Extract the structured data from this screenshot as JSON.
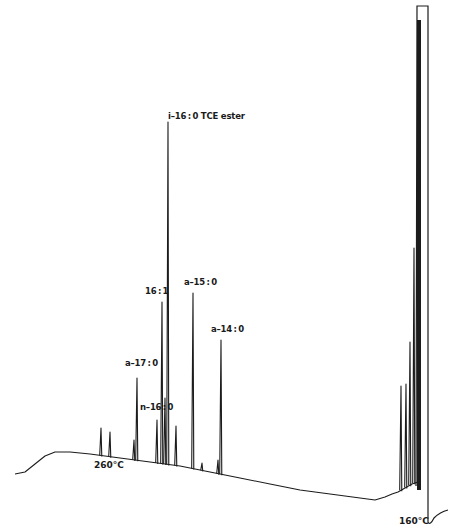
{
  "chart_data": {
    "type": "line",
    "title": "",
    "subtitle": "Gas chromatogram of fatty acid methyl/TCE esters (temperature-programmed)",
    "xlabel": "",
    "ylabel": "",
    "x_direction": "reversed (retention time increases right to left)",
    "grid": false,
    "legend": null,
    "temperature_markers": [
      {
        "label": "260°C",
        "x": 110,
        "y": 465
      },
      {
        "label": "160°C",
        "x": 418,
        "y": 520
      }
    ],
    "peaks": [
      {
        "name": "i-16:0 TCE ester",
        "label_x": 168,
        "label_y": 117,
        "peak_x": 168,
        "top_y": 122,
        "base_y": 466
      },
      {
        "name": "16:1",
        "label_x": 145,
        "label_y": 292,
        "peak_x": 162,
        "top_y": 302,
        "base_y": 466
      },
      {
        "name": "a-15:0",
        "label_x": 184,
        "label_y": 283,
        "peak_x": 193,
        "top_y": 293,
        "base_y": 468
      },
      {
        "name": "a-14:0",
        "label_x": 211,
        "label_y": 330,
        "peak_x": 221,
        "top_y": 340,
        "base_y": 476
      },
      {
        "name": "a-17:0",
        "label_x": 125,
        "label_y": 364,
        "peak_x": 137,
        "top_y": 378,
        "base_y": 462
      },
      {
        "name": "n-16:0",
        "label_x": 140,
        "label_y": 408,
        "peak_x": 157,
        "top_y": 420,
        "base_y": 464
      },
      {
        "name": "",
        "peak_x": 101,
        "top_y": 428,
        "base_y": 460
      },
      {
        "name": "",
        "peak_x": 110,
        "top_y": 432,
        "base_y": 460
      },
      {
        "name": "",
        "peak_x": 134,
        "top_y": 440,
        "base_y": 462
      },
      {
        "name": "",
        "peak_x": 165,
        "top_y": 398,
        "base_y": 466
      },
      {
        "name": "",
        "peak_x": 176,
        "top_y": 426,
        "base_y": 466
      },
      {
        "name": "",
        "peak_x": 202,
        "top_y": 463,
        "base_y": 470
      },
      {
        "name": "",
        "peak_x": 218,
        "top_y": 460,
        "base_y": 476
      },
      {
        "name": "",
        "peak_x": 401,
        "top_y": 386,
        "base_y": 495
      },
      {
        "name": "",
        "peak_x": 406,
        "top_y": 384,
        "base_y": 492
      },
      {
        "name": "",
        "peak_x": 410,
        "top_y": 342,
        "base_y": 488
      },
      {
        "name": "",
        "peak_x": 414,
        "top_y": 248,
        "base_y": 486
      },
      {
        "name": "solvent",
        "peak_x": 420,
        "top_y": 6,
        "base_y": 522
      }
    ],
    "baseline": [
      [
        15,
        474
      ],
      [
        25,
        472
      ],
      [
        35,
        464
      ],
      [
        45,
        456
      ],
      [
        55,
        452
      ],
      [
        70,
        452
      ],
      [
        90,
        454
      ],
      [
        120,
        458
      ],
      [
        150,
        462
      ],
      [
        180,
        466
      ],
      [
        210,
        472
      ],
      [
        240,
        478
      ],
      [
        270,
        484
      ],
      [
        300,
        490
      ],
      [
        330,
        494
      ],
      [
        360,
        498
      ],
      [
        375,
        500
      ],
      [
        385,
        497
      ],
      [
        392,
        494
      ],
      [
        398,
        492
      ],
      [
        405,
        488
      ],
      [
        412,
        484
      ],
      [
        418,
        482
      ]
    ]
  }
}
